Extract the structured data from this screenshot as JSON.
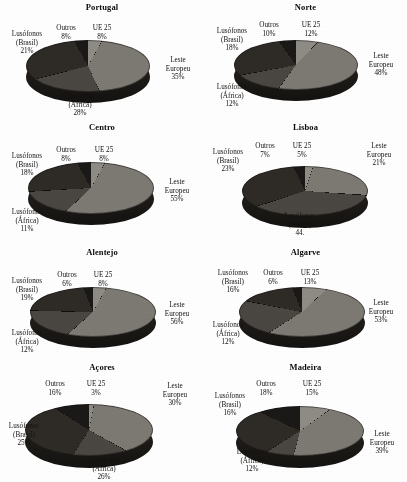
{
  "figure": {
    "type": "pie-grid",
    "rows": 4,
    "columns": 2,
    "note": "Eight 3-D pie charts, grayscale scanned figure"
  },
  "categories": [
    "UE 25",
    "Leste Europeu",
    "Lusófonos (África)",
    "Lusófonos (Brasil)",
    "Outros"
  ],
  "colors": {
    "ue25": "#8f8c86",
    "leste_europeu": "#7d7a74",
    "lusofonos_africa": "#4a4641",
    "lusofonos_brasil": "#2e2b27",
    "outros": "#1b1917",
    "side": "#26231f",
    "text": "#13110f",
    "background": "#ffffff"
  },
  "chart_data": [
    {
      "type": "pie",
      "title": "Portugal",
      "categories": [
        "UE 25",
        "Leste Europeu",
        "Lusófonos (África)",
        "Lusófonos (Brasil)",
        "Outros"
      ],
      "values": [
        8,
        35,
        28,
        21,
        8
      ],
      "labels": [
        {
          "name": "UE 25",
          "value": "8%",
          "line1": "UE 25",
          "line2": "8%"
        },
        {
          "name": "Leste Europeu",
          "value": "35%",
          "line1": "Leste",
          "line2": "Europeu",
          "line3": "35%"
        },
        {
          "name": "Lusófonos (África)",
          "value": "28%",
          "line1": "Lusófonos",
          "line2": "(África)",
          "line3": "28%"
        },
        {
          "name": "Lusófonos (Brasil)",
          "value": "21%",
          "line1": "Lusófonos",
          "line2": "(Brasil)",
          "line3": "21%"
        },
        {
          "name": "Outros",
          "value": "8%",
          "line1": "Outros",
          "line2": "8%"
        }
      ]
    },
    {
      "type": "pie",
      "title": "Norte",
      "categories": [
        "UE 25",
        "Leste Europeu",
        "Lusófonos (África)",
        "Lusófonos (Brasil)",
        "Outros"
      ],
      "values": [
        12,
        48,
        12,
        18,
        10
      ],
      "labels": [
        {
          "name": "UE 25",
          "value": "12%",
          "line1": "UE 25",
          "line2": "12%"
        },
        {
          "name": "Leste Europeu",
          "value": "48%",
          "line1": "Leste",
          "line2": "Europeu",
          "line3": "48%"
        },
        {
          "name": "Lusófonos (África)",
          "value": "12%",
          "line1": "Lusófonos",
          "line2": "(África)",
          "line3": "12%"
        },
        {
          "name": "Lusófonos (Brasil)",
          "value": "18%",
          "line1": "Lusófonos",
          "line2": "(Brasil)",
          "line3": "18%"
        },
        {
          "name": "Outros",
          "value": "10%",
          "line1": "Outros",
          "line2": "10%"
        }
      ]
    },
    {
      "type": "pie",
      "title": "Centro",
      "categories": [
        "UE 25",
        "Leste Europeu",
        "Lusófonos (África)",
        "Lusófonos (Brasil)",
        "Outros"
      ],
      "values": [
        8,
        55,
        11,
        18,
        8
      ],
      "labels": [
        {
          "name": "UE 25",
          "value": "8%",
          "line1": "UE 25",
          "line2": "8%"
        },
        {
          "name": "Leste Europeu",
          "value": "55%",
          "line1": "Leste",
          "line2": "Europeu",
          "line3": "55%"
        },
        {
          "name": "Lusófonos (África)",
          "value": "11%",
          "line1": "Lusófonos",
          "line2": "(África)",
          "line3": "11%"
        },
        {
          "name": "Lusófonos (Brasil)",
          "value": "18%",
          "line1": "Lusófonos",
          "line2": "(Brasil)",
          "line3": "18%"
        },
        {
          "name": "Outros",
          "value": "8%",
          "line1": "Outros",
          "line2": "8%"
        }
      ]
    },
    {
      "type": "pie",
      "title": "Lisboa",
      "categories": [
        "UE 25",
        "Leste Europeu",
        "Lusófonos (África)",
        "Lusófonos (Brasil)",
        "Outros"
      ],
      "values": [
        5,
        21,
        44,
        23,
        7
      ],
      "labels": [
        {
          "name": "UE 25",
          "value": "5%",
          "line1": "UE 25",
          "line2": "5%"
        },
        {
          "name": "Leste Europeu",
          "value": "21%",
          "line1": "Leste",
          "line2": "Europeu",
          "line3": "21%"
        },
        {
          "name": "Lusófonos (África)",
          "value": "44.",
          "line1": "Lusófonos",
          "line2": "(África)",
          "line3": "44."
        },
        {
          "name": "Lusófonos (Brasil)",
          "value": "23%",
          "line1": "Lusófonos",
          "line2": "(Brasil)",
          "line3": "23%"
        },
        {
          "name": "Outros",
          "value": "7%",
          "line1": "Outros",
          "line2": "7%"
        }
      ]
    },
    {
      "type": "pie",
      "title": "Alentejo",
      "categories": [
        "UE 25",
        "Leste Europeu",
        "Lusófonos (África)",
        "Lusófonos (Brasil)",
        "Outros"
      ],
      "values": [
        8,
        56,
        12,
        19,
        6
      ],
      "labels": [
        {
          "name": "UE 25",
          "value": "8%",
          "line1": "UE 25",
          "line2": "8%"
        },
        {
          "name": "Leste Europeu",
          "value": "56%",
          "line1": "Leste",
          "line2": "Europeu",
          "line3": "56%"
        },
        {
          "name": "Lusófonos (África)",
          "value": "12%",
          "line1": "Lusófonos",
          "line2": "(África)",
          "line3": "12%"
        },
        {
          "name": "Lusófonos (Brasil)",
          "value": "19%",
          "line1": "Lusófonos",
          "line2": "(Brasil)",
          "line3": "19%"
        },
        {
          "name": "Outros",
          "value": "6%",
          "line1": "Outros",
          "line2": "6%"
        }
      ]
    },
    {
      "type": "pie",
      "title": "Algarve",
      "categories": [
        "UE 25",
        "Leste Europeu",
        "Lusófonos (África)",
        "Lusófonos (Brasil)",
        "Outros"
      ],
      "values": [
        13,
        53,
        12,
        16,
        6
      ],
      "labels": [
        {
          "name": "UE 25",
          "value": "13%",
          "line1": "UE 25",
          "line2": "13%"
        },
        {
          "name": "Leste Europeu",
          "value": "53%",
          "line1": "Leste",
          "line2": "Europeu",
          "line3": "53%"
        },
        {
          "name": "Lusófonos (África)",
          "value": "12%",
          "line1": "Lusófonos",
          "line2": "(África)",
          "line3": "12%"
        },
        {
          "name": "Lusófonos (Brasil)",
          "value": "16%",
          "line1": "Lusófonos",
          "line2": "(Brasil)",
          "line3": "16%"
        },
        {
          "name": "Outros",
          "value": "6%",
          "line1": "Outros",
          "line2": "6%"
        }
      ]
    },
    {
      "type": "pie",
      "title": "Açores",
      "categories": [
        "UE 25",
        "Leste Europeu",
        "Lusófonos (África)",
        "Lusófonos (Brasil)",
        "Outros"
      ],
      "values": [
        3,
        30,
        26,
        25,
        16
      ],
      "labels": [
        {
          "name": "UE 25",
          "value": "3%",
          "line1": "UE 25",
          "line2": "3%"
        },
        {
          "name": "Leste Europeu",
          "value": "30%",
          "line1": "Leste",
          "line2": "Europeu",
          "line3": "30%"
        },
        {
          "name": "Lusófonos (África)",
          "value": "26%",
          "line1": "Lusófonos",
          "line2": "(África)",
          "line3": "26%"
        },
        {
          "name": "Lusófonos (Brasil)",
          "value": "25%",
          "line1": "Lusófonos",
          "line2": "(Brasil)",
          "line3": "25%"
        },
        {
          "name": "Outros",
          "value": "16%",
          "line1": "Outros",
          "line2": "16%"
        }
      ]
    },
    {
      "type": "pie",
      "title": "Madeira",
      "categories": [
        "UE 25",
        "Leste Europeu",
        "Lusófonos (África)",
        "Lusófonos (Brasil)",
        "Outros"
      ],
      "values": [
        15,
        39,
        12,
        16,
        18
      ],
      "labels": [
        {
          "name": "UE 25",
          "value": "15%",
          "line1": "UE 25",
          "line2": "15%"
        },
        {
          "name": "Leste Europeu",
          "value": "39%",
          "line1": "Leste",
          "line2": "Europeu",
          "line3": "39%"
        },
        {
          "name": "Lusófonos (África)",
          "value": "12%",
          "line1": "Lusófonos",
          "line2": "(África)",
          "line3": "12%"
        },
        {
          "name": "Lusófonos (Brasil)",
          "value": "16%",
          "line1": "Lusófonos",
          "line2": "(Brasil)",
          "line3": "16%"
        },
        {
          "name": "Outros",
          "value": "18%",
          "line1": "Outros",
          "line2": "18%"
        }
      ]
    }
  ]
}
